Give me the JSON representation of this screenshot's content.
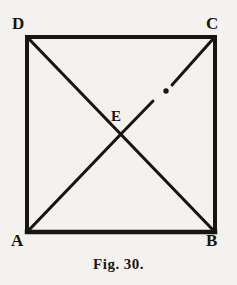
{
  "figure": {
    "caption_prefix": "Fig.",
    "caption_number": "30",
    "caption_terminator": ".",
    "background_color": "#f4f2ee",
    "ink_color": "#17150f"
  },
  "diagram": {
    "type": "geometric-figure",
    "shape": "square-with-diagonals",
    "square": {
      "left": 27,
      "top": 37,
      "right": 215,
      "bottom": 232,
      "stroke_width": 3.5
    },
    "vertices": [
      {
        "id": "D",
        "label": "D",
        "corner": "top-left",
        "x": 27,
        "y": 37,
        "label_x": 12,
        "label_y": 15
      },
      {
        "id": "C",
        "label": "C",
        "corner": "top-right",
        "x": 215,
        "y": 37,
        "label_x": 206,
        "label_y": 15
      },
      {
        "id": "A",
        "label": "A",
        "corner": "bottom-left",
        "x": 27,
        "y": 232,
        "label_x": 11,
        "label_y": 232
      },
      {
        "id": "B",
        "label": "B",
        "corner": "bottom-right",
        "x": 215,
        "y": 232,
        "label_x": 206,
        "label_y": 232
      }
    ],
    "center_point": {
      "id": "E",
      "label": "E",
      "x": 121,
      "y": 134,
      "label_x": 111,
      "label_y": 109
    },
    "diagonals": [
      {
        "id": "D-B",
        "from": "D",
        "to": "B",
        "style": "solid"
      },
      {
        "id": "A-C",
        "from": "A",
        "to": "C",
        "style": "solid-with-break",
        "break_note": "gap and dot on the segment between E and C"
      }
    ],
    "marks": [
      {
        "id": "dot-on-EC",
        "type": "dot",
        "x": 166,
        "y": 91,
        "radius": 2.6
      }
    ]
  }
}
